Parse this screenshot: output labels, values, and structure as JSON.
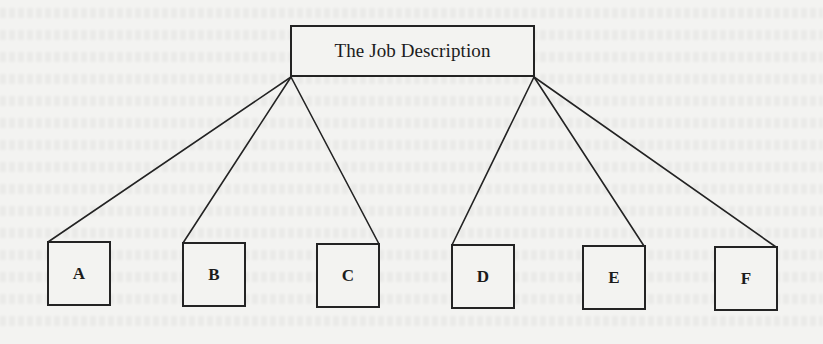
{
  "diagram": {
    "type": "hierarchy-tree",
    "root": {
      "label": "The Job Description"
    },
    "children": [
      {
        "id": "A",
        "label": "A"
      },
      {
        "id": "B",
        "label": "B"
      },
      {
        "id": "C",
        "label": "C"
      },
      {
        "id": "D",
        "label": "D"
      },
      {
        "id": "E",
        "label": "E"
      },
      {
        "id": "F",
        "label": "F"
      }
    ],
    "edges": [
      {
        "from": "root",
        "to": "A"
      },
      {
        "from": "root",
        "to": "B"
      },
      {
        "from": "root",
        "to": "C"
      },
      {
        "from": "root",
        "to": "D"
      },
      {
        "from": "root",
        "to": "E"
      },
      {
        "from": "root",
        "to": "F"
      }
    ],
    "colors": {
      "line": "#232323",
      "background": "#f3f3f1",
      "text": "#1c1c1c"
    }
  }
}
